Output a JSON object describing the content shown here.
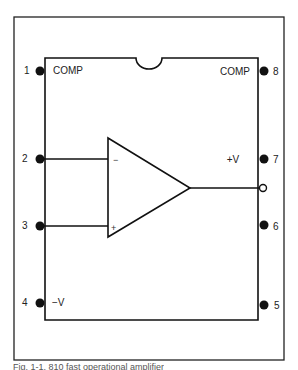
{
  "diagram": {
    "type": "op-amp pinout (8-pin DIP)",
    "pins": [
      {
        "number": "1",
        "label": "COMP",
        "side": "left"
      },
      {
        "number": "2",
        "label": "",
        "side": "left",
        "connects_to": "inverting input (-)"
      },
      {
        "number": "3",
        "label": "",
        "side": "left",
        "connects_to": "non-inverting input (+)"
      },
      {
        "number": "4",
        "label": "−V",
        "side": "left"
      },
      {
        "number": "5",
        "label": "",
        "side": "right"
      },
      {
        "number": "6",
        "label": "",
        "side": "right"
      },
      {
        "number": "7",
        "label": "+V",
        "side": "right"
      },
      {
        "number": "8",
        "label": "COMP",
        "side": "right"
      }
    ],
    "opamp": {
      "inverting_sign": "−",
      "noninverting_sign": "+",
      "output": "open circle output terminal"
    },
    "caption": "Fig. 1-1. 810 fast operational amplifier"
  }
}
